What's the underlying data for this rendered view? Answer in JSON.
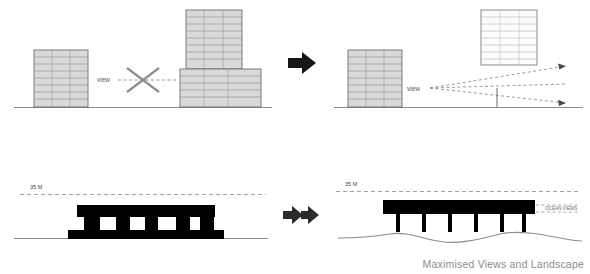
{
  "diagram": {
    "caption": "Maximised Views and Landscape",
    "labels": {
      "view_left": "view",
      "view_right": "view",
      "height_left": "35 M",
      "height_right": "35 M",
      "ocean_views": "OCEAN VIEWS"
    },
    "arrows": {
      "top_arrow": "arrow-right",
      "bottom_arrow": "arrow-right-double"
    },
    "colors": {
      "building_fill": "#d9d9d9",
      "building_stroke": "#7a7a7a",
      "silhouette_fill": "#000000",
      "ground_line": "#8a8a8a",
      "dashed_line": "#808080",
      "arrow_fill": "#1a1a1a",
      "caption_color": "#8c8c8c",
      "x_mark": "#888888"
    },
    "panels": [
      {
        "id": "top-left",
        "name": "blocked-view-before",
        "description": "Two massing blocks blocking a view line, marked with an X"
      },
      {
        "id": "top-right",
        "name": "open-view-after",
        "description": "Tower lifted above podium opening radiating sight lines"
      },
      {
        "id": "bottom-left",
        "name": "section-dense-before",
        "description": "Dense black section massing under 35 M height line"
      },
      {
        "id": "bottom-right",
        "name": "section-elevated-after",
        "description": "Elevated slab on columns under 35 M height line with ocean views"
      }
    ]
  }
}
